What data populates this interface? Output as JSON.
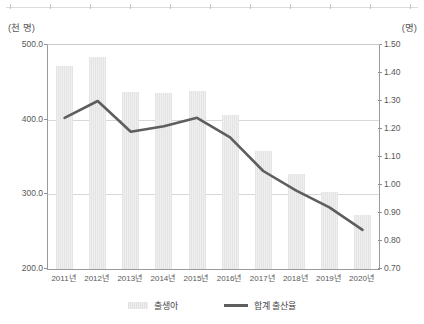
{
  "axes": {
    "left_unit_label": "(천 명)",
    "right_unit_label": "(명)",
    "left_ticks": [
      "500.0",
      "400.0",
      "300.0",
      "200.0"
    ],
    "right_ticks": [
      "1.50",
      "1.40",
      "1.30",
      "1.20",
      "1.10",
      "1.00",
      "0.90",
      "0.80",
      "0.70"
    ]
  },
  "legend": {
    "bar_label": "출생아",
    "line_label": "합계 출산율"
  },
  "chart_data": {
    "type": "bar",
    "title": "",
    "subtitle": "",
    "xlabel": "",
    "ylabel": "(천 명)",
    "y2label": "(명)",
    "grid": true,
    "legend_position": "bottom",
    "ylim": [
      200.0,
      500.0
    ],
    "y2lim": [
      0.7,
      1.5
    ],
    "ytick_step": 100.0,
    "y2tick_step": 0.1,
    "categories": [
      "2011년",
      "2012년",
      "2013년",
      "2014년",
      "2015년",
      "2016년",
      "2017년",
      "2018년",
      "2019년",
      "2020년"
    ],
    "series": [
      {
        "name": "출생아",
        "type": "bar",
        "axis": "left",
        "unit": "천 명",
        "color": "#e8e8e8",
        "values": [
          471.3,
          484.6,
          436.5,
          435.4,
          438.4,
          406.2,
          357.8,
          326.8,
          302.7,
          272.3
        ]
      },
      {
        "name": "합계 출산율",
        "type": "line",
        "axis": "right",
        "unit": "명",
        "color": "#5e5e5e",
        "values": [
          1.24,
          1.3,
          1.19,
          1.21,
          1.24,
          1.17,
          1.05,
          0.98,
          0.92,
          0.84
        ]
      }
    ]
  }
}
